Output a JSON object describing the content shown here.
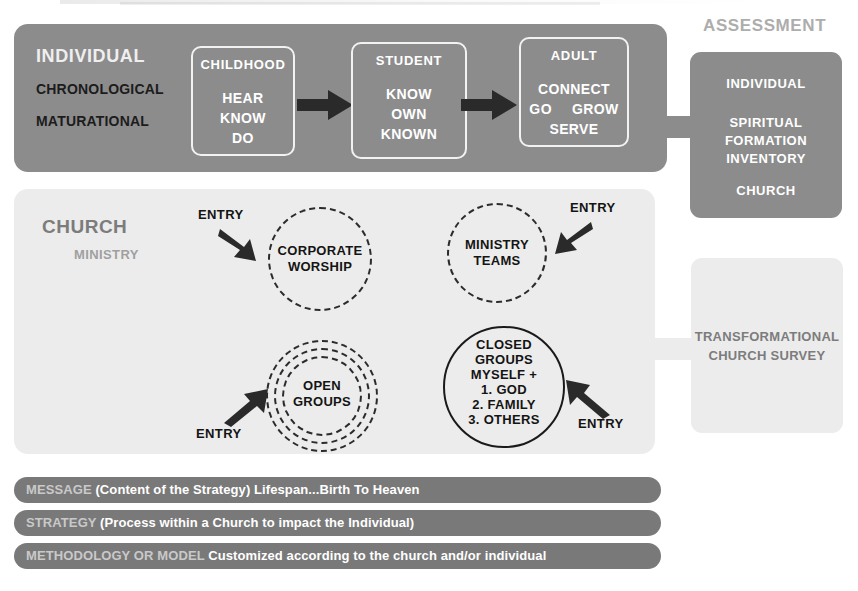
{
  "diagram": {
    "individual": {
      "title": "INDIVIDUAL",
      "sub1": "CHRONOLOGICAL",
      "sub2": "MATURATIONAL",
      "stages": [
        {
          "head": "CHILDHOOD",
          "lines": [
            "HEAR",
            "KNOW",
            "DO"
          ]
        },
        {
          "head": "STUDENT",
          "lines": [
            "KNOW",
            "OWN",
            "KNOWN"
          ]
        },
        {
          "head": "ADULT",
          "row_left": "GO",
          "row_center": "CONNECT",
          "row_right": "GROW",
          "row_bottom": "SERVE"
        }
      ]
    },
    "assessment": {
      "label": "ASSESSMENT",
      "line1": "INDIVIDUAL",
      "line2": "SPIRITUAL\nFORMATION\nINVENTORY",
      "line3": "CHURCH"
    },
    "church": {
      "title": "CHURCH",
      "sub": "MINISTRY",
      "circles": [
        {
          "name": "corporate-worship",
          "label": "CORPORATE\nWORSHIP",
          "style": "dashed"
        },
        {
          "name": "ministry-teams",
          "label": "MINISTRY\nTEAMS",
          "style": "dashed"
        },
        {
          "name": "open-groups",
          "label": "OPEN\nGROUPS",
          "style": "dashed-triple"
        },
        {
          "name": "closed-groups",
          "label": "CLOSED\nGROUPS\nMYSELF +\n1. GOD\n2. FAMILY\n3. OTHERS",
          "style": "solid"
        }
      ],
      "entries": [
        "ENTRY",
        "ENTRY",
        "ENTRY",
        "ENTRY"
      ]
    },
    "survey": {
      "text": "TRANSFORMATIONAL\nCHURCH SURVEY"
    },
    "bars": [
      {
        "key": "MESSAGE",
        "rest": " (Content of the Strategy) Lifespan...Birth To Heaven"
      },
      {
        "key": "STRATEGY",
        "rest": " (Process within a Church to impact the Individual)"
      },
      {
        "key": "METHODOLOGY OR MODEL",
        "rest": "  Customized according to the church and/or individual"
      }
    ],
    "colors": {
      "band_gray": "#8c8c8c",
      "panel_light": "#ececec",
      "bar_gray": "#797979",
      "title_gray": "#7c7c7c",
      "assessment_label_gray": "#adadad",
      "ink": "#141414"
    }
  }
}
